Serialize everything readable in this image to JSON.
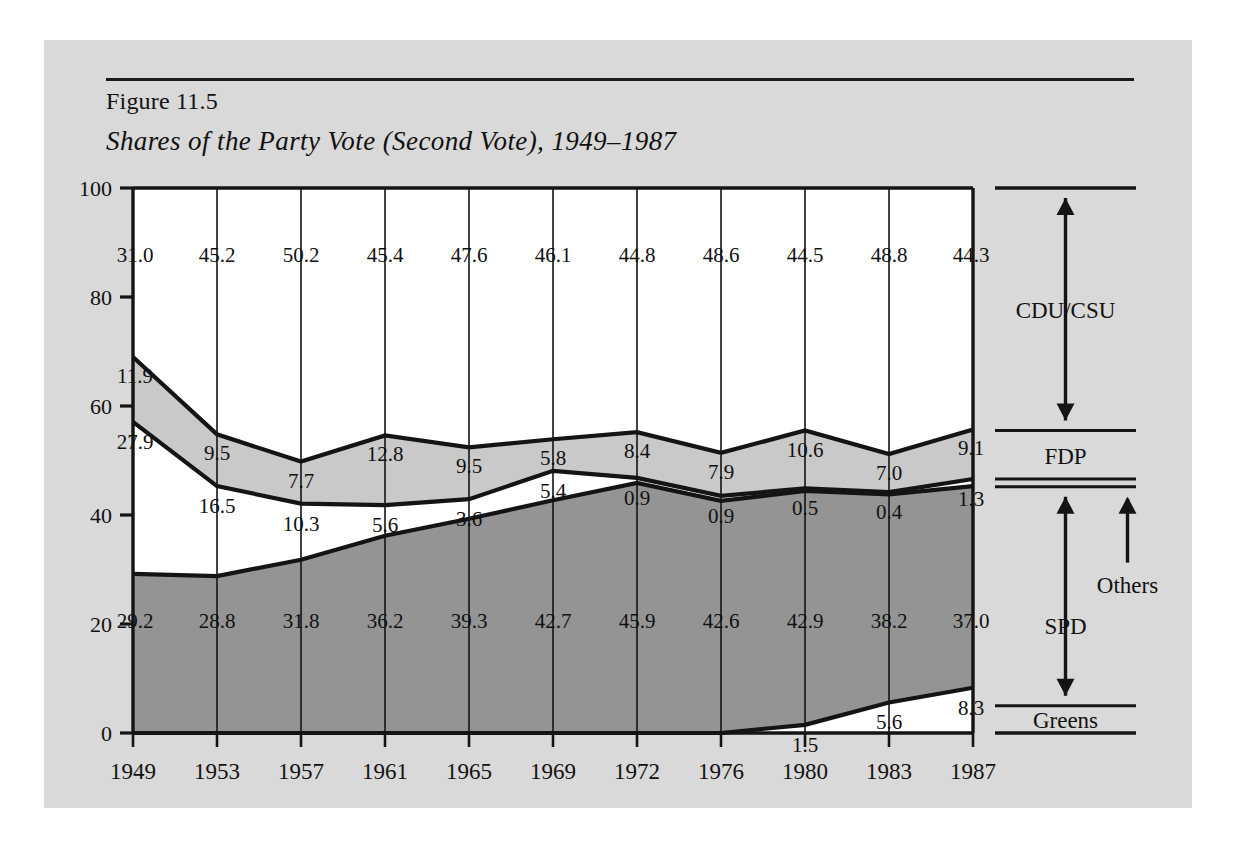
{
  "figure": {
    "label": "Figure 11.5",
    "title": "Shares of the Party Vote (Second Vote), 1949–1987"
  },
  "legend": {
    "cdu": "CDU/CSU",
    "fdp": "FDP",
    "others": "Others",
    "spd": "SPD",
    "greens": "Greens"
  },
  "colors": {
    "page_background": "#d9d9d9",
    "plot_background": "#ffffff",
    "cdu_fill": "#ffffff",
    "fdp_fill": "#c9c9c9",
    "others_fill": "#ffffff",
    "spd_fill": "#949494",
    "greens_fill": "#ffffff",
    "line": "#141414",
    "text": "#111111"
  },
  "chart_data": {
    "type": "area",
    "title": "Shares of the Party Vote (Second Vote), 1949–1987",
    "xlabel": "",
    "ylabel": "",
    "ylim": [
      0,
      100
    ],
    "yticks": [
      0,
      20,
      40,
      60,
      80,
      100
    ],
    "grid": true,
    "legend_position": "right",
    "stack_order_bottom_to_top": [
      "Greens",
      "SPD",
      "Others",
      "FDP",
      "CDU/CSU"
    ],
    "categories": [
      "1949",
      "1953",
      "1957",
      "1961",
      "1965",
      "1969",
      "1972",
      "1976",
      "1980",
      "1983",
      "1987"
    ],
    "series": [
      {
        "name": "Greens",
        "values": [
          0.0,
          0.0,
          0.0,
          0.0,
          0.0,
          0.0,
          0.0,
          0.0,
          1.5,
          5.6,
          8.3
        ],
        "labels": [
          "",
          "",
          "",
          "",
          "",
          "",
          "",
          "",
          "1.5",
          "5.6",
          "8.3"
        ]
      },
      {
        "name": "SPD",
        "values": [
          29.2,
          28.8,
          31.8,
          36.2,
          39.3,
          42.7,
          45.9,
          42.6,
          42.9,
          38.2,
          37.0
        ],
        "labels": [
          "29.2",
          "28.8",
          "31.8",
          "36.2",
          "39.3",
          "42.7",
          "45.9",
          "42.6",
          "42.9",
          "38.2",
          "37.0"
        ]
      },
      {
        "name": "Others",
        "values": [
          27.9,
          16.5,
          10.3,
          5.6,
          3.6,
          5.4,
          0.9,
          0.9,
          0.5,
          0.4,
          1.3
        ],
        "labels": [
          "27.9",
          "16.5",
          "10.3",
          "5.6",
          "3.6",
          "5.4",
          "0.9",
          "0.9",
          "0.5",
          "0.4",
          "1.3"
        ]
      },
      {
        "name": "FDP",
        "values": [
          11.9,
          9.5,
          7.7,
          12.8,
          9.5,
          5.8,
          8.4,
          7.9,
          10.6,
          7.0,
          9.1
        ],
        "labels": [
          "11.9",
          "9.5",
          "7.7",
          "12.8",
          "9.5",
          "5.8",
          "8.4",
          "7.9",
          "10.6",
          "7.0",
          "9.1"
        ]
      },
      {
        "name": "CDU/CSU",
        "values": [
          31.0,
          45.2,
          50.2,
          45.4,
          47.6,
          46.1,
          44.8,
          48.6,
          44.5,
          48.8,
          44.3
        ],
        "labels": [
          "31.0",
          "45.2",
          "50.2",
          "45.4",
          "47.6",
          "46.1",
          "44.8",
          "48.6",
          "44.5",
          "48.8",
          "44.3"
        ]
      }
    ]
  }
}
